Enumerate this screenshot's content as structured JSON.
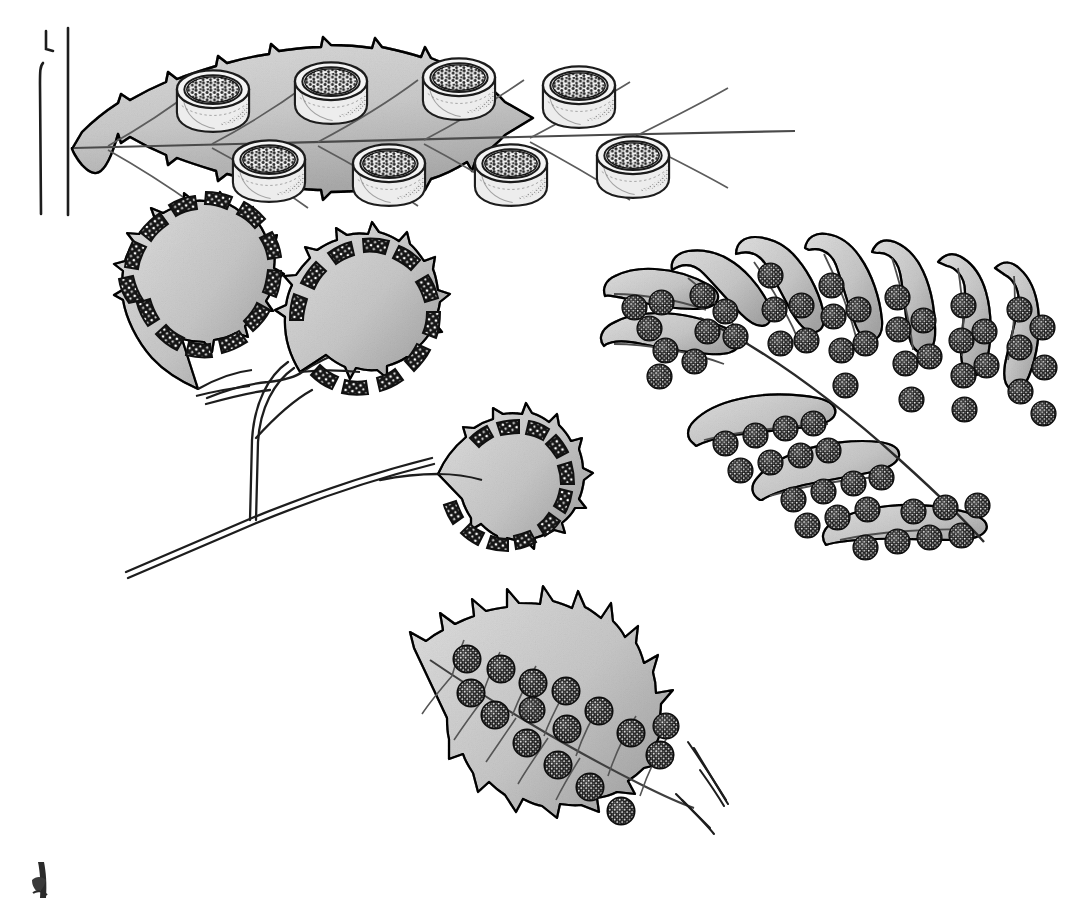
{
  "figure": {
    "title": "spore sacks on fern leaf",
    "medium": "pen-and-ink botanical line drawing",
    "background_color": "#ffffff",
    "ink_color": "#1a1a1a",
    "leaf_fill_color": "#e3e3e3",
    "leaf_fill_shadow": "#c9c9c9",
    "sorus_color": "#141414",
    "sorus_speckle_color": "#ffffff"
  },
  "caption": {
    "line1": "spore sacks",
    "line2": "on fern leaf"
  },
  "panels": [
    {
      "id": "panel-1",
      "name": "serrated-leaf-with-cup-sporangia",
      "label": "serrated fern pinna bearing eight cup-shaped spore sacks",
      "sporangia_count": 8,
      "sporangia_upper_row": 4,
      "sporangia_lower_row": 4,
      "margin": "serrate",
      "has_rachis": true,
      "rachis_lines": 2
    },
    {
      "id": "panel-2",
      "name": "maidenhair-fan-leaflets",
      "label": "three fan-shaped maidenhair pinnules with marginal sori on wiry stalks",
      "leaflet_count": 3,
      "margin": "lobed with reflexed false indusia",
      "stalk_style": "wiry double-line"
    },
    {
      "id": "panel-3",
      "name": "pinnate-frond-with-round-sori",
      "label": "pinnately lobed fern frond with paired rows of round sori on each lobe",
      "lobe_count": 11,
      "sori_per_lobe": "4 to 7",
      "margin": "entire wavy"
    },
    {
      "id": "panel-4",
      "name": "spiny-pinnule-with-round-sori",
      "label": "spiny-toothed fern pinnule with round sori along the veins",
      "sori_count": 16,
      "margin": "spinulose-dentate"
    },
    {
      "id": "panel-5",
      "name": "cropped-figure-fragment",
      "label": "partial cropped drawing fragment at lower left edge"
    }
  ]
}
